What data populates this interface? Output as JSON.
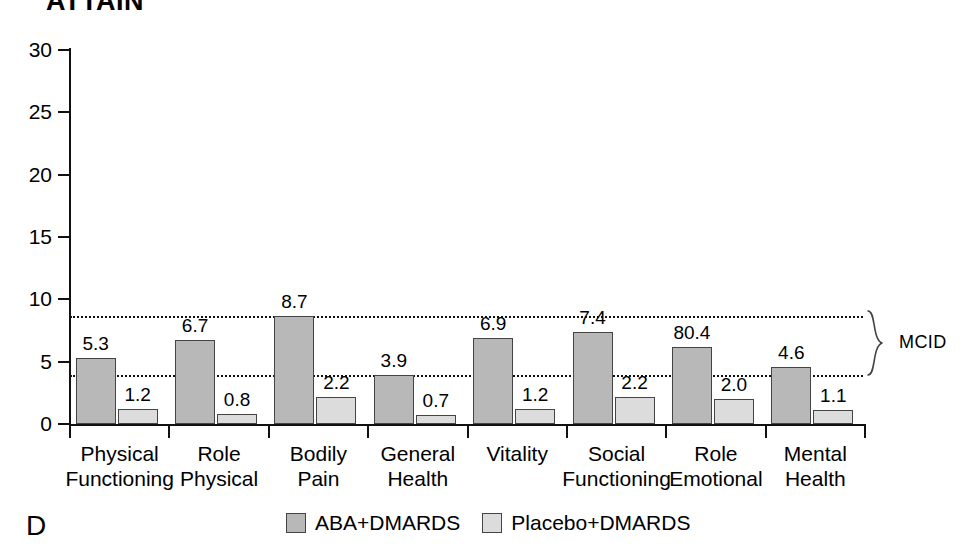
{
  "chart_data": {
    "type": "bar",
    "title": "ATTAIN",
    "panel_letter": "D",
    "xlabel": "",
    "ylabel": "",
    "ylim": [
      0,
      30
    ],
    "yticks": [
      0,
      5,
      10,
      15,
      20,
      25,
      30
    ],
    "grid": false,
    "legend_position": "bottom",
    "categories": [
      "Physical Functioning",
      "Role Physical",
      "Bodily Pain",
      "General Health",
      "Vitality",
      "Social Functioning",
      "Role Emotional",
      "Mental Health"
    ],
    "category_lines": [
      [
        "Physical",
        "Functioning"
      ],
      [
        "Role",
        "Physical"
      ],
      [
        "Bodily",
        "Pain"
      ],
      [
        "General",
        "Health"
      ],
      [
        "Vitality",
        ""
      ],
      [
        "Social",
        "Functioning"
      ],
      [
        "Role",
        "Emotional"
      ],
      [
        "Mental",
        "Health"
      ]
    ],
    "series": [
      {
        "name": "ABA+DMARDS",
        "color": "#b8b8b8",
        "values": [
          5.3,
          6.7,
          8.7,
          3.9,
          6.9,
          7.4,
          6.2,
          4.6
        ],
        "labels": [
          "5.3",
          "6.7",
          "8.7",
          "3.9",
          "6.9",
          "7.4",
          "80.4",
          "4.6"
        ]
      },
      {
        "name": "Placebo+DMARDS",
        "color": "#dcdcdc",
        "values": [
          1.2,
          0.8,
          2.2,
          0.7,
          1.2,
          2.2,
          2.0,
          1.1
        ],
        "labels": [
          "1.2",
          "0.8",
          "2.2",
          "0.7",
          "1.2",
          "2.2",
          "2.0",
          "1.1"
        ]
      }
    ],
    "annotations": [
      {
        "name": "MCID",
        "label": "MCID",
        "type": "band",
        "lower": 3.9,
        "upper": 8.7,
        "style": "dotted"
      }
    ]
  },
  "legend": {
    "items": [
      {
        "label": "ABA+DMARDS",
        "color": "#b8b8b8"
      },
      {
        "label": "Placebo+DMARDS",
        "color": "#dcdcdc"
      }
    ]
  }
}
